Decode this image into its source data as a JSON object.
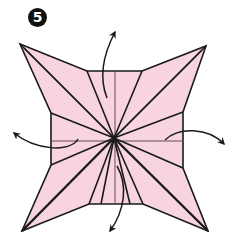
{
  "diagram": {
    "step_number": "5",
    "paper_color": "#f7d4de",
    "line_color": "#1a1a1a",
    "crease_color": "#6b4a52",
    "background": "#ffffff",
    "center": [
      114,
      138
    ],
    "outline": [
      [
        20,
        44
      ],
      [
        87,
        71
      ],
      [
        142,
        71
      ],
      [
        206,
        46
      ],
      [
        183,
        112
      ],
      [
        183,
        168
      ],
      [
        208,
        231
      ],
      [
        143,
        204
      ],
      [
        89,
        204
      ],
      [
        22,
        231
      ],
      [
        51,
        165
      ],
      [
        51,
        113
      ]
    ],
    "points": {
      "top_left": [
        20,
        44
      ],
      "top_right": [
        206,
        46
      ],
      "bottom_left": [
        22,
        231
      ],
      "bottom_right": [
        208,
        231
      ]
    },
    "arrows": [
      {
        "name": "arrow-up",
        "direction": "up"
      },
      {
        "name": "arrow-left",
        "direction": "left"
      },
      {
        "name": "arrow-right",
        "direction": "right"
      },
      {
        "name": "arrow-down",
        "direction": "down"
      }
    ]
  }
}
